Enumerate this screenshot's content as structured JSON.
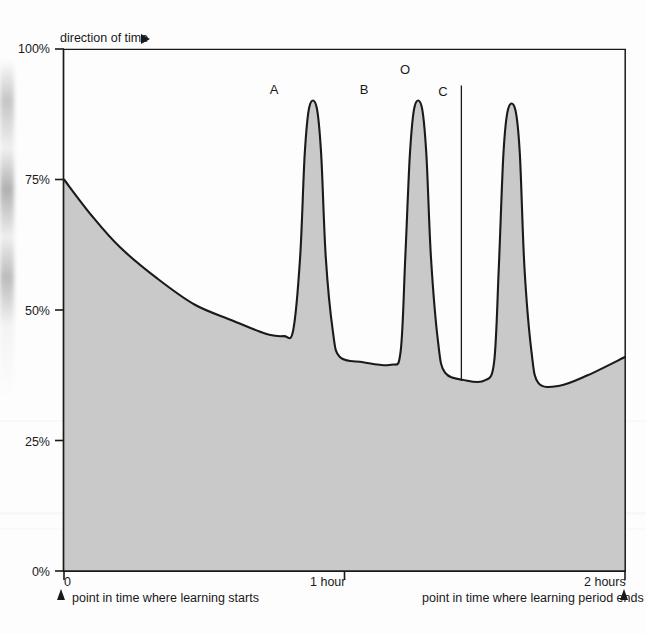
{
  "chart_data": {
    "type": "area",
    "title": "",
    "subtitle": "",
    "xlabel": "",
    "ylabel": "",
    "xlim": [
      0,
      120
    ],
    "ylim": [
      0,
      100
    ],
    "grid": false,
    "legend_position": "none",
    "x_unit": "minutes",
    "y_unit": "percent",
    "x_tick_values": [
      0,
      60,
      120
    ],
    "x_tick_labels": [
      "0",
      "1 hour",
      "2 hours"
    ],
    "y_tick_values": [
      0,
      25,
      50,
      75,
      100
    ],
    "y_tick_labels": [
      "0%",
      "25%",
      "50%",
      "75%",
      "100%"
    ],
    "series": [
      {
        "name": "retention",
        "description": "Retention curve decaying after learning, with three review spikes",
        "points": [
          {
            "x": 0,
            "y": 75
          },
          {
            "x": 6,
            "y": 68
          },
          {
            "x": 12,
            "y": 62
          },
          {
            "x": 20,
            "y": 56
          },
          {
            "x": 28,
            "y": 51
          },
          {
            "x": 36,
            "y": 48
          },
          {
            "x": 43,
            "y": 45.5
          },
          {
            "x": 47,
            "y": 45
          },
          {
            "x": 49,
            "y": 46
          },
          {
            "x": 50.5,
            "y": 60
          },
          {
            "x": 51.5,
            "y": 80
          },
          {
            "x": 52.5,
            "y": 89
          },
          {
            "x": 54,
            "y": 89
          },
          {
            "x": 55,
            "y": 80
          },
          {
            "x": 56,
            "y": 60
          },
          {
            "x": 57.5,
            "y": 46
          },
          {
            "x": 59,
            "y": 41
          },
          {
            "x": 64,
            "y": 40
          },
          {
            "x": 70,
            "y": 39.5
          },
          {
            "x": 72,
            "y": 42
          },
          {
            "x": 73,
            "y": 60
          },
          {
            "x": 74,
            "y": 80
          },
          {
            "x": 75,
            "y": 89
          },
          {
            "x": 76.5,
            "y": 89
          },
          {
            "x": 77.5,
            "y": 80
          },
          {
            "x": 78.5,
            "y": 60
          },
          {
            "x": 80,
            "y": 44
          },
          {
            "x": 81.5,
            "y": 38
          },
          {
            "x": 86,
            "y": 36.5
          },
          {
            "x": 90,
            "y": 36.5
          },
          {
            "x": 92,
            "y": 40
          },
          {
            "x": 93,
            "y": 58
          },
          {
            "x": 94,
            "y": 80
          },
          {
            "x": 95,
            "y": 88.5
          },
          {
            "x": 96.5,
            "y": 88.5
          },
          {
            "x": 97.5,
            "y": 80
          },
          {
            "x": 98.5,
            "y": 58
          },
          {
            "x": 100,
            "y": 42
          },
          {
            "x": 101.5,
            "y": 36
          },
          {
            "x": 106,
            "y": 35.5
          },
          {
            "x": 112,
            "y": 37.5
          },
          {
            "x": 120,
            "y": 41
          }
        ]
      }
    ],
    "annotations": [
      {
        "name": "peak-a",
        "label": "A",
        "x": 53,
        "y": 89
      },
      {
        "name": "peak-b",
        "label": "B",
        "x": 75.5,
        "y": 89
      },
      {
        "name": "marker-o",
        "label": "O",
        "x": 85,
        "y": 93
      },
      {
        "name": "peak-c",
        "label": "C",
        "x": 95.5,
        "y": 88.5
      }
    ],
    "colors": {
      "fill": "#c9c9c9",
      "curve": "#1a1a1a",
      "axis": "#1a1a1a",
      "text": "#1a1a1a",
      "marker_line": "#1a1a1a"
    }
  },
  "axes": {
    "direction_note": "direction of time",
    "direction_arrow_icon": "triangle-right-icon",
    "y_ticks": [
      {
        "label": "100%",
        "value": 100
      },
      {
        "label": "75%",
        "value": 75
      },
      {
        "label": "50%",
        "value": 50
      },
      {
        "label": "25%",
        "value": 25
      },
      {
        "label": "0%",
        "value": 0
      }
    ],
    "x_ticks": [
      {
        "label": "0",
        "value": 0
      },
      {
        "label": "1 hour",
        "value": 60
      },
      {
        "label": "2 hours",
        "value": 120
      }
    ]
  },
  "annotations": {
    "peak_a": "A",
    "peak_b": "B",
    "marker_o": "O",
    "peak_c": "C"
  },
  "captions": {
    "start_marker_icon": "triangle-up-icon",
    "start_text": "point in time where learning starts",
    "end_text": "point in time where learning period ends",
    "end_marker_icon": "triangle-up-icon"
  }
}
